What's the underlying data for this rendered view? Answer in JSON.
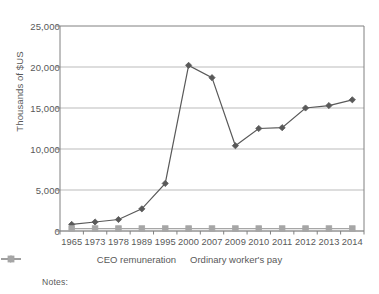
{
  "chart_data": {
    "type": "line",
    "title": "",
    "xlabel": "",
    "ylabel": "Thousands of $US",
    "categories": [
      "1965",
      "1973",
      "1978",
      "1989",
      "1995",
      "2000",
      "2007",
      "2009",
      "2010",
      "2011",
      "2012",
      "2013",
      "2014"
    ],
    "ylim": [
      0,
      25000
    ],
    "yticks": [
      0,
      5000,
      10000,
      15000,
      20000,
      25000
    ],
    "ytick_labels": [
      "0",
      "5,000",
      "10,000",
      "15,000",
      "20,000",
      "25,000"
    ],
    "grid": true,
    "legend_position": "bottom",
    "series": [
      {
        "name": "CEO remuneration",
        "marker": "diamond",
        "color": "#595959",
        "values": [
          800,
          1100,
          1400,
          2700,
          5800,
          20200,
          18700,
          10400,
          12500,
          12600,
          15000,
          15300,
          16000
        ]
      },
      {
        "name": "Ordinary worker's pay",
        "marker": "square",
        "color": "#a6a6a6",
        "values": [
          300,
          300,
          300,
          300,
          300,
          300,
          300,
          300,
          300,
          300,
          300,
          300,
          300
        ]
      }
    ]
  },
  "legend": {
    "items": [
      {
        "label": "CEO remuneration"
      },
      {
        "label": "Ordinary worker's pay"
      }
    ]
  },
  "footer": {
    "notes_label": "Notes:"
  },
  "colors": {
    "series_1": "#595959",
    "series_2": "#a6a6a6",
    "grid": "#b3b3b3",
    "axis": "#808080",
    "text": "#595959",
    "background": "#ffffff"
  }
}
